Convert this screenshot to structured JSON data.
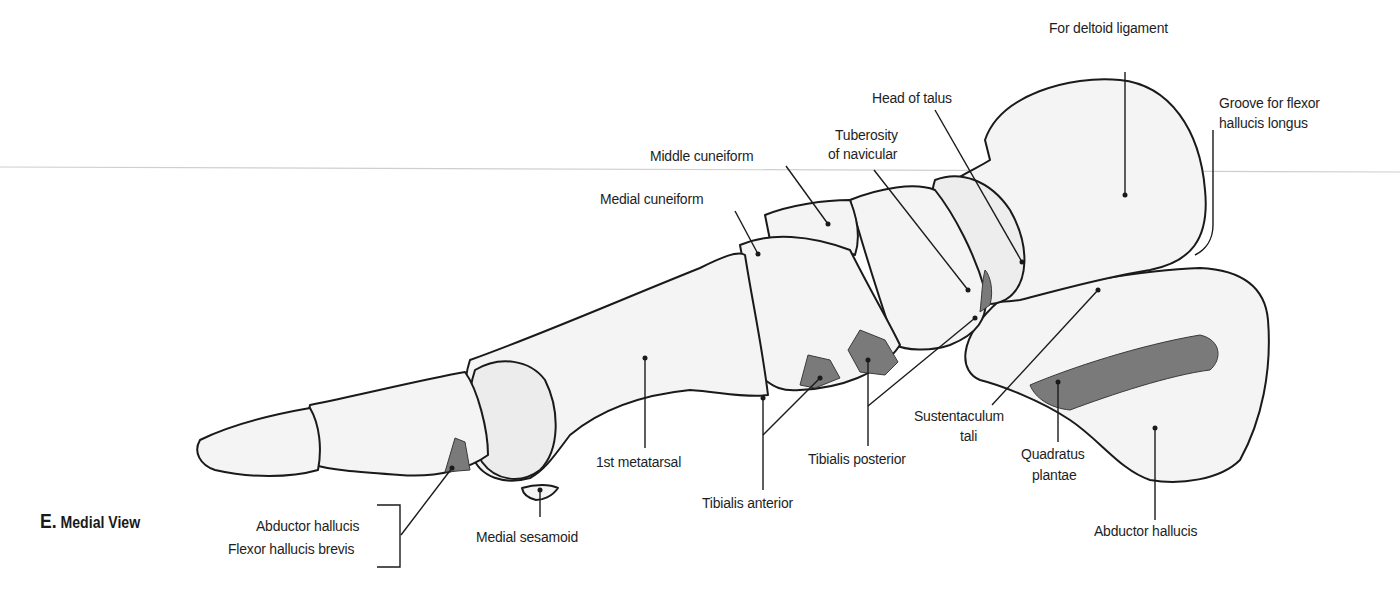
{
  "figure": {
    "letter": "E.",
    "title": "Medial View",
    "colors": {
      "bone_fill": "#f4f4f4",
      "bone_outline": "#1a1a1a",
      "attachment_fill": "#7a7a7a",
      "leader_line": "#1a1a1a",
      "divider_line": "#cfcfcf"
    }
  },
  "labels": {
    "for_deltoid_ligament": "For deltoid ligament",
    "groove_fhl_1": "Groove for flexor",
    "groove_fhl_2": "hallucis longus",
    "head_of_talus": "Head of talus",
    "tuberosity_1": "Tuberosity",
    "tuberosity_2": "of navicular",
    "middle_cuneiform": "Middle cuneiform",
    "medial_cuneiform": "Medial cuneiform",
    "first_metatarsal": "1st metatarsal",
    "tibialis_anterior": "Tibialis anterior",
    "tibialis_posterior": "Tibialis posterior",
    "sustentaculum_1": "Sustentaculum",
    "sustentaculum_2": "tali",
    "quadratus_1": "Quadratus",
    "quadratus_2": "plantae",
    "abductor_hallucis_calc": "Abductor hallucis",
    "medial_sesamoid": "Medial sesamoid",
    "abductor_hallucis_toe": "Abductor hallucis",
    "flexor_hallucis_brevis": "Flexor hallucis brevis"
  }
}
